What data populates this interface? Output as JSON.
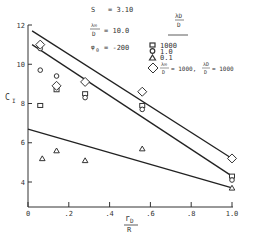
{
  "chart_data": {
    "type": "scatter",
    "title": "",
    "xlabel": "r_D / R",
    "ylabel": "C_I",
    "xlim": [
      0,
      1.0
    ],
    "ylim": [
      2.7,
      12
    ],
    "x_ticks": [
      0,
      0.2,
      0.4,
      0.6,
      0.8,
      1.0
    ],
    "x_tick_labels": [
      "0",
      ".2",
      ".4",
      ".6",
      ".8",
      "1.0"
    ],
    "y_ticks": [
      4,
      6,
      8,
      10,
      12
    ],
    "y_tick_labels": [
      "4",
      "6",
      "8",
      "10",
      "12"
    ],
    "grid": false,
    "annotations": [
      {
        "label": "S",
        "value": "= 3.10"
      },
      {
        "label": "λ∞/D",
        "value": "= 10.0"
      },
      {
        "label": "φ0",
        "value": "= -200"
      }
    ],
    "legend": {
      "title": "λD/D",
      "position": "upper right",
      "entries": [
        {
          "marker": "square",
          "label": "1000"
        },
        {
          "marker": "circle",
          "label": "1.0"
        },
        {
          "marker": "triangle",
          "label": "0.1"
        },
        {
          "marker": "diamond",
          "label": "λ∞/D = 1000, λD/D = 1000"
        }
      ]
    },
    "series": [
      {
        "name": "λD/D = 1000",
        "marker": "square",
        "x": [
          0.06,
          0.14,
          0.28,
          0.56,
          1.0
        ],
        "y": [
          7.9,
          8.7,
          8.5,
          7.9,
          4.3
        ]
      },
      {
        "name": "λD/D = 1.0",
        "marker": "circle",
        "x": [
          0.06,
          0.06,
          0.14,
          0.28,
          0.56,
          1.0
        ],
        "y": [
          10.8,
          9.7,
          9.4,
          8.3,
          7.7,
          4.1
        ]
      },
      {
        "name": "λD/D = 0.1",
        "marker": "triangle",
        "x": [
          0.07,
          0.14,
          0.28,
          0.56,
          1.0
        ],
        "y": [
          5.2,
          5.6,
          5.1,
          5.7,
          3.7
        ]
      },
      {
        "name": "λ∞/D = 1000, λD/D = 1000",
        "marker": "diamond",
        "x": [
          0.06,
          0.14,
          0.28,
          0.56,
          1.0
        ],
        "y": [
          11.0,
          8.9,
          9.1,
          8.6,
          5.2
        ]
      }
    ],
    "fit_lines": [
      {
        "name": "upper fit",
        "x": [
          0.02,
          1.0
        ],
        "y": [
          11.7,
          5.2
        ]
      },
      {
        "name": "middle fit",
        "x": [
          0.02,
          1.0
        ],
        "y": [
          11.0,
          4.3
        ]
      },
      {
        "name": "lower fit",
        "x": [
          0.0,
          1.0
        ],
        "y": [
          6.7,
          3.7
        ]
      }
    ]
  },
  "labels": {
    "ylabel_main": "C",
    "ylabel_sub": "I",
    "xlabel_num": "r",
    "xlabel_num_sub": "D",
    "xlabel_den": "R",
    "s_label": "S",
    "s_value": "= 3.10",
    "lam_label": "λ∞",
    "lam_den": "D",
    "lam_value": "= 10.0",
    "phi_label": "φ",
    "phi_sub": "0",
    "phi_value": "= -200",
    "legend_title_num": "λD",
    "legend_title_den": "D",
    "legend_1000": "1000",
    "legend_1": "1.0",
    "legend_01": "0.1",
    "legend_combo_lam": "λ∞",
    "legend_combo_den1": "D",
    "legend_combo_eq1": "= 1000,",
    "legend_combo_lamD": "λD",
    "legend_combo_den2": "D",
    "legend_combo_eq2": "= 1000"
  }
}
